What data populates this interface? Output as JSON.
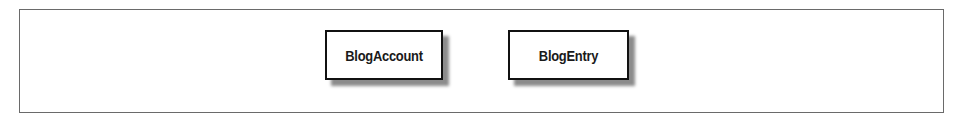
{
  "diagram": {
    "type": "entity-diagram",
    "entities": [
      {
        "id": "blogaccount",
        "label": "BlogAccount"
      },
      {
        "id": "blogentry",
        "label": "BlogEntry"
      }
    ],
    "relationships": []
  }
}
